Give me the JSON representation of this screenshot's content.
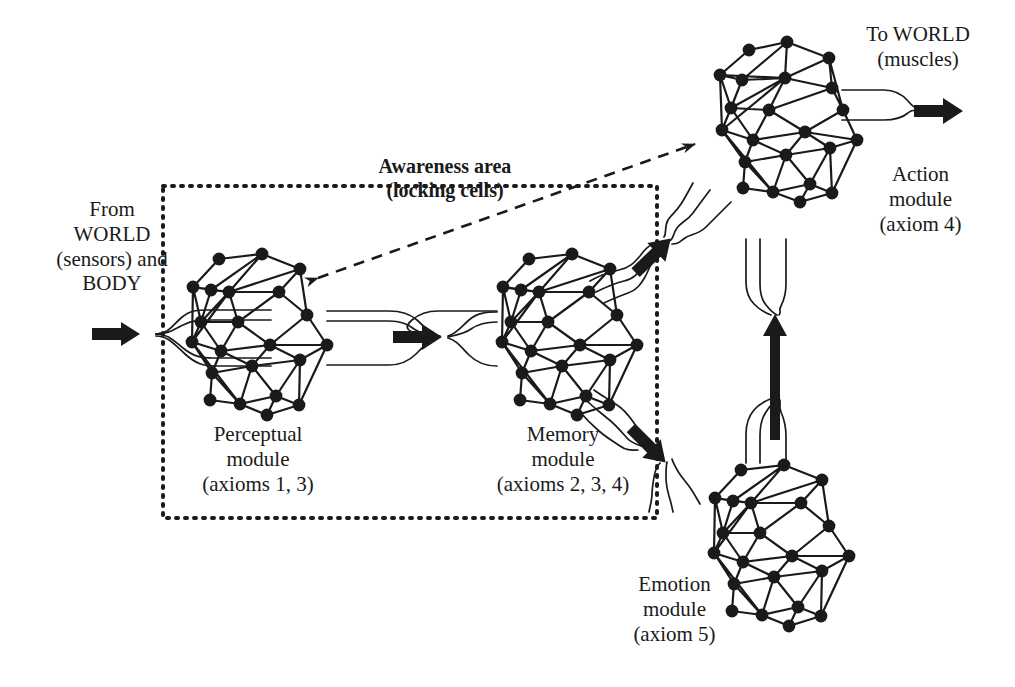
{
  "figure": {
    "type": "diagram",
    "background_color": "#ffffff",
    "ink_color": "#1a1a1a"
  },
  "annotations": {
    "awareness": {
      "line1": "Awareness area",
      "line2": "(locking cells)",
      "style": "bold",
      "boundary": "dotted rectangle enclosing perceptual and memory modules"
    }
  },
  "io": {
    "input": {
      "line1": "From",
      "line2": "WORLD",
      "line3": "(sensors) and",
      "line4": "BODY",
      "arrow": "thick-right-arrow"
    },
    "output": {
      "line1": "To WORLD",
      "line2": "(muscles)",
      "arrow": "thick-right-arrow"
    }
  },
  "modules": [
    {
      "id": "perceptual",
      "name_line1": "Perceptual",
      "name_line2": "module",
      "axioms_label": "(axioms 1, 3)",
      "inside_awareness_area": true
    },
    {
      "id": "memory",
      "name_line1": "Memory",
      "name_line2": "module",
      "axioms_label": "(axioms 2, 3, 4)",
      "inside_awareness_area": true
    },
    {
      "id": "action",
      "name_line1": "Action",
      "name_line2": "module",
      "axioms_label": "(axiom 4)",
      "inside_awareness_area": false
    },
    {
      "id": "emotion",
      "name_line1": "Emotion",
      "name_line2": "module",
      "axioms_label": "(axiom 5)",
      "inside_awareness_area": false
    }
  ],
  "connections": [
    {
      "from": "world-input",
      "to": "perceptual",
      "style": "nerve-bundle",
      "arrow": "thick"
    },
    {
      "from": "perceptual",
      "to": "memory",
      "style": "nerve-bundle",
      "arrow": "thick"
    },
    {
      "from": "memory",
      "to": "action",
      "style": "nerve-bundle",
      "arrow": "thick"
    },
    {
      "from": "memory",
      "to": "emotion",
      "style": "nerve-bundle",
      "arrow": "thick"
    },
    {
      "from": "emotion",
      "to": "action",
      "style": "nerve-bundle",
      "arrow": "thick"
    },
    {
      "from": "action",
      "to": "world-output",
      "style": "nerve-bundle",
      "arrow": "thick"
    },
    {
      "from": "perceptual",
      "to": "action",
      "style": "dashed",
      "arrow": "double-headed"
    }
  ]
}
